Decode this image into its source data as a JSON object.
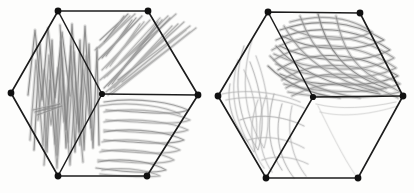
{
  "image": {
    "title": "Hand-drawn hexagonal graph sketches with pencil scribble shading",
    "description": "Two hexagon wireframe drawings side by side, each with six outer vertices and one central vertex, filled with grey pencil scribbles",
    "background_color": "#fdfdfc",
    "paper_tone": "#fdfdfb",
    "ink_color": "#1c1c1c",
    "pencil_color": "#8a8a8a",
    "width": 414,
    "height": 193
  },
  "figures": [
    {
      "id": "hexagon-left",
      "label": "Left hexagon",
      "center": {
        "x": 102,
        "y": 94
      },
      "vertices": [
        {
          "name": "top-left",
          "x": 58,
          "y": 11
        },
        {
          "name": "top-right",
          "x": 148,
          "y": 11
        },
        {
          "name": "right",
          "x": 198,
          "y": 95
        },
        {
          "name": "bottom-right",
          "x": 147,
          "y": 176
        },
        {
          "name": "bottom-left",
          "x": 58,
          "y": 176
        },
        {
          "name": "left",
          "x": 11,
          "y": 93
        },
        {
          "name": "center",
          "x": 102,
          "y": 94
        }
      ],
      "spokes": [
        "top-left",
        "right",
        "bottom-left"
      ],
      "faces": [
        {
          "name": "left-face",
          "shading": "dense-vertical-zigzag",
          "darkness": "heavy"
        },
        {
          "name": "top-right-face",
          "shading": "diagonal-strokes",
          "darkness": "medium"
        },
        {
          "name": "bottom-right-face",
          "shading": "horizontal-loops",
          "darkness": "medium"
        }
      ]
    },
    {
      "id": "hexagon-right",
      "label": "Right hexagon",
      "center": {
        "x": 313,
        "y": 97
      },
      "vertices": [
        {
          "name": "top-left",
          "x": 268,
          "y": 12
        },
        {
          "name": "top-right",
          "x": 360,
          "y": 13
        },
        {
          "name": "right",
          "x": 403,
          "y": 96
        },
        {
          "name": "bottom-right",
          "x": 358,
          "y": 178
        },
        {
          "name": "bottom-left",
          "x": 266,
          "y": 178
        },
        {
          "name": "left",
          "x": 218,
          "y": 96
        },
        {
          "name": "center",
          "x": 313,
          "y": 97
        }
      ],
      "spokes": [
        "top-left",
        "right",
        "bottom-left"
      ],
      "faces": [
        {
          "name": "top-face",
          "shading": "wide-overlapping-loops",
          "darkness": "heavy"
        },
        {
          "name": "lower-left-face",
          "shading": "sparse-vertical-loops",
          "darkness": "light"
        },
        {
          "name": "lower-right-face",
          "shading": "minimal",
          "darkness": "very-light"
        }
      ]
    }
  ],
  "scribbles": {
    "left_hex_left_face": [
      "M 34 150 L 40 44 L 47 152 L 52 40 L 57 155 L 61 42 L 66 148 L 71 46 L 75 152 L 80 40 L 84 150 L 89 44 L 93 148 L 97 48 L 99 145",
      "M 30 140 L 36 60 L 43 146 L 49 55 L 55 144 L 62 58 L 68 142 L 74 52 L 80 145 L 86 56 L 92 140",
      "M 38 120 L 44 70 L 51 125 L 58 68 L 64 122 L 70 66 L 77 124 L 83 70 L 90 120",
      "M 28 95 L 35 30 L 42 100 L 48 28 L 55 98 L 62 32 L 70 96",
      "M 44 165 L 50 80 L 57 168 L 63 78 L 70 165 L 76 82 L 83 162",
      "M 33 110 L 60 104 L 35 112 L 62 106 L 37 115",
      "M 60 25 L 66 130 L 72 24 L 79 132 L 85 26 L 91 128"
    ],
    "left_hex_top_right_face": [
      "M 104 88 L 170 18 L 108 86 L 162 20 L 112 84 L 158 22",
      "M 100 80 L 176 14 L 104 78 L 168 16 L 107 76 L 160 18",
      "M 102 70 L 150 20 L 106 68 L 144 22 L 110 66 L 140 24",
      "M 98 60 L 142 16 L 102 58 L 136 18 L 106 56 L 132 20",
      "M 106 92 L 184 22 L 110 90 L 178 24 L 114 88 L 172 26",
      "M 95 50 L 135 14 L 99 48 L 130 16",
      "M 100 40 L 128 14 L 104 42 L 124 16",
      "M 118 80 L 190 26 L 122 82 L 186 30",
      "M 108 95 L 196 28 L 112 94 L 190 32"
    ],
    "left_hex_bottom_right_face": [
      "M 104 102 C 140 96 175 104 188 110 C 175 116 140 112 106 110",
      "M 104 112 C 142 106 178 114 190 120 C 176 126 140 122 106 120",
      "M 104 122 C 140 116 176 124 188 130 C 174 136 138 132 104 130",
      "M 104 132 C 138 126 172 134 184 140 C 170 146 136 142 104 140",
      "M 102 142 C 136 136 168 144 180 150 C 166 156 132 152 102 150",
      "M 100 152 C 132 146 164 154 174 160 C 160 166 128 162 98 160",
      "M 98 162 C 128 156 156 164 166 170 C 152 174 124 172 96 168",
      "M 100 106 C 134 100 168 108 180 114",
      "M 102 170 C 130 166 152 172 160 176 C 146 178 120 176 100 174"
    ],
    "right_hex_top_face": [
      "M 276 40 C 310 24 355 26 390 50 C 360 66 310 62 280 46",
      "M 272 50 C 306 30 356 32 394 58 C 362 76 306 70 274 54",
      "M 274 60 C 308 38 358 42 396 68 C 364 84 306 78 276 64",
      "M 278 70 C 312 48 360 52 398 76 C 366 90 308 86 280 74",
      "M 282 80 C 316 58 362 62 400 84 C 368 96 312 92 284 84",
      "M 286 88 C 320 68 364 70 400 92 C 370 100 316 98 288 92",
      "M 280 30 C 314 18 352 20 384 40 C 354 54 310 50 282 36",
      "M 290 22 C 320 14 348 16 372 32 C 348 44 312 40 290 28",
      "M 292 96 C 326 78 366 80 398 98",
      "M 276 46 C 296 70 330 86 380 94",
      "M 284 26 C 300 56 330 80 378 92",
      "M 300 16 C 312 50 336 78 382 90",
      "M 318 14 C 326 48 344 74 386 88",
      "M 336 16 C 342 46 352 70 390 86",
      "M 270 56 C 290 78 320 92 360 98",
      "M 268 66 C 284 82 308 94 340 98"
    ],
    "right_hex_lower_left_face": [
      "M 244 46 C 232 80 238 120 258 150 C 266 124 262 92 250 62",
      "M 238 60 C 228 92 236 126 254 152 C 260 128 256 96 244 70",
      "M 252 40 C 240 78 244 118 264 148 C 272 120 268 88 256 56",
      "M 230 84 C 226 104 234 126 248 142",
      "M 258 100 C 248 126 250 150 264 168",
      "M 266 96 C 256 124 258 152 272 172",
      "M 274 94 C 266 122 268 150 282 170",
      "M 222 94 C 250 88 282 94 300 102",
      "M 226 100 C 254 94 286 100 304 108",
      "M 240 120 C 262 112 288 118 304 126",
      "M 248 140 C 268 134 290 140 304 148",
      "M 262 160 C 278 154 296 158 308 164",
      "M 282 104 C 274 130 278 158 294 178",
      "M 292 106 C 286 132 292 158 306 176"
    ],
    "right_hex_lower_right_face": [
      "M 316 104 C 340 110 368 108 396 102",
      "M 320 112 C 344 118 372 114 398 106",
      "M 318 106 C 330 130 342 156 356 176"
    ]
  }
}
